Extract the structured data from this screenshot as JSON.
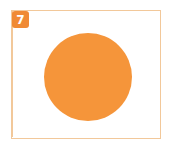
{
  "badge": {
    "label": "7",
    "color": "#f08a34"
  },
  "frame": {
    "border_color": "#f2c89a"
  },
  "circle": {
    "color": "#f5953a",
    "cx": 88,
    "cy": 77,
    "r": 44
  }
}
